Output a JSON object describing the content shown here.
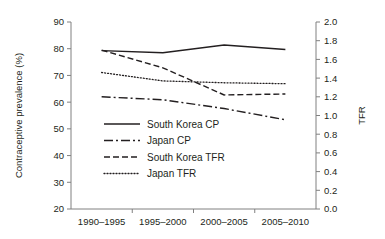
{
  "chart_data": {
    "type": "line",
    "title": "",
    "categories": [
      "1990–1995",
      "1995–2000",
      "2000–2005",
      "2005–2010"
    ],
    "xlabel": "",
    "ylabel": "Contraceptive prevalence (%)",
    "y2label": "TFR",
    "ylim": [
      20,
      90
    ],
    "ytick_step": 10,
    "yticks": [
      "90",
      "80",
      "70",
      "60",
      "50",
      "40",
      "30",
      "20"
    ],
    "y2lim": [
      0.0,
      2.0
    ],
    "y2tick_step": 0.2,
    "y2ticks": [
      "2.0",
      "1.8",
      "1.6",
      "1.4",
      "1.2",
      "1.0",
      "0.8",
      "0.6",
      "0.4",
      "0.2",
      "0.0"
    ],
    "grid": false,
    "legend_position": "center-left-inside",
    "series": [
      {
        "name": "South Korea CP",
        "axis": "left",
        "style": "solid",
        "color": "#231f20",
        "values": [
          79.3,
          78.5,
          81.4,
          79.7
        ]
      },
      {
        "name": "Japan CP",
        "axis": "left",
        "style": "dashdot",
        "color": "#231f20",
        "values": [
          62.0,
          60.9,
          57.6,
          53.4
        ]
      },
      {
        "name": "South Korea TFR",
        "axis": "right",
        "style": "dashed",
        "color": "#231f20",
        "values": [
          1.7,
          1.51,
          1.22,
          1.23
        ]
      },
      {
        "name": "Japan TFR",
        "axis": "right",
        "style": "dotted",
        "color": "#231f20",
        "values": [
          1.46,
          1.37,
          1.35,
          1.34
        ]
      }
    ]
  }
}
